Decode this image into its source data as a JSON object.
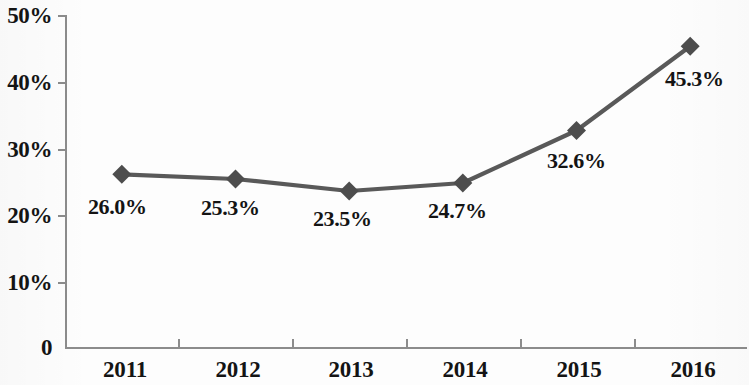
{
  "chart_data": {
    "type": "line",
    "title": "",
    "subtitle": "",
    "xlabel": "",
    "ylabel": "",
    "categories": [
      "2011",
      "2012",
      "2013",
      "2014",
      "2015",
      "2016"
    ],
    "values": [
      26.0,
      25.3,
      23.5,
      24.7,
      32.6,
      45.3
    ],
    "data_labels": [
      "26.0%",
      "25.3%",
      "23.5%",
      "24.7%",
      "32.6%",
      "45.3%"
    ],
    "series": [
      {
        "name": "",
        "values": [
          26.0,
          25.3,
          23.5,
          24.7,
          32.6,
          45.3
        ]
      }
    ],
    "ylim": [
      0,
      50
    ],
    "y_ticks": [
      0,
      10,
      20,
      30,
      40,
      50
    ],
    "y_tick_labels": [
      "0",
      "10%",
      "20%",
      "30%",
      "40%",
      "50%"
    ],
    "x_tick_labels": [
      "2011",
      "2012",
      "2013",
      "2014",
      "2015",
      "2016"
    ],
    "grid": false,
    "legend": false,
    "legend_position": "none",
    "marker": "diamond",
    "colors": {
      "line": "#595959",
      "marker": "#4d4d4d",
      "axis": "#8c8c8c",
      "text": "#141414",
      "background": "#fdfdfd"
    }
  },
  "axes": {
    "y_labels": [
      {
        "text": "50%",
        "value": 50
      },
      {
        "text": "40%",
        "value": 40
      },
      {
        "text": "30%",
        "value": 30
      },
      {
        "text": "20%",
        "value": 20
      },
      {
        "text": "10%",
        "value": 10
      },
      {
        "text": "0",
        "value": 0
      }
    ],
    "x_labels": [
      {
        "text": "2011"
      },
      {
        "text": "2012"
      },
      {
        "text": "2013"
      },
      {
        "text": "2014"
      },
      {
        "text": "2015"
      },
      {
        "text": "2016"
      }
    ]
  },
  "points": [
    {
      "label": "26.0%",
      "category": "2011",
      "value": 26.0
    },
    {
      "label": "25.3%",
      "category": "2012",
      "value": 25.3
    },
    {
      "label": "23.5%",
      "category": "2013",
      "value": 23.5
    },
    {
      "label": "24.7%",
      "category": "2014",
      "value": 24.7
    },
    {
      "label": "32.6%",
      "category": "2015",
      "value": 32.6
    },
    {
      "label": "45.3%",
      "category": "2016",
      "value": 45.3
    }
  ]
}
